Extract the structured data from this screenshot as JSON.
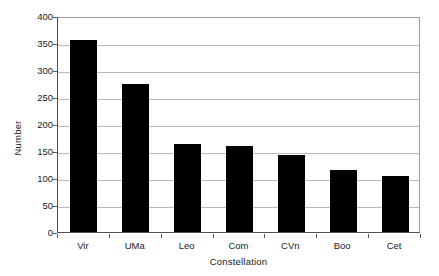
{
  "chart_data": {
    "type": "bar",
    "title": "",
    "subtitle": "",
    "xlabel": "Constellation",
    "ylabel": "Number",
    "categories": [
      "Vir",
      "UMa",
      "Leo",
      "Com",
      "CVn",
      "Boo",
      "Cet"
    ],
    "values": [
      356,
      275,
      163,
      159,
      143,
      114,
      104
    ],
    "ylim": [
      0,
      400
    ],
    "ytick_labels": [
      "400",
      "350",
      "300",
      "250",
      "200",
      "150",
      "100",
      "50",
      "0"
    ],
    "ytick_values": [
      400,
      350,
      300,
      250,
      200,
      150,
      100,
      50,
      0
    ],
    "ytick_step": 50,
    "grid": true,
    "grid_axis": "y",
    "legend": false,
    "legend_position": "none",
    "bar_color": "#000000",
    "grid_color": "#b6babe",
    "frame_color": "#9a9ea2",
    "axis_color": "#4a4e52",
    "background_color": "#ffffff",
    "text_color": "#1a1a1a",
    "annotations": []
  }
}
